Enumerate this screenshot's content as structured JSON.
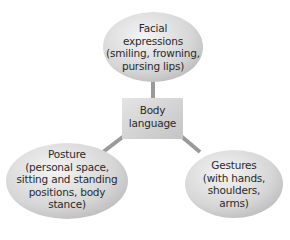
{
  "diagram": {
    "center": {
      "label_line1": "Body",
      "label_line2": "language"
    },
    "nodes": [
      {
        "id": "facial",
        "lines": [
          "Facial",
          "expressions",
          "(smiling, frowning,",
          "pursing lips)"
        ]
      },
      {
        "id": "posture",
        "lines": [
          "Posture",
          "(personal space,",
          "sitting and standing",
          "positions, body",
          "stance)"
        ]
      },
      {
        "id": "gestures",
        "lines": [
          "Gestures",
          "(with hands,",
          "shoulders,",
          "arms)"
        ]
      }
    ],
    "colors": {
      "ellipse_fill": "#d9d9d9",
      "ellipse_highlight": "#f2f2f2",
      "box_fill": "#d4d4d4",
      "connector": "#9a9a9a",
      "text": "#2a2a2a"
    }
  }
}
